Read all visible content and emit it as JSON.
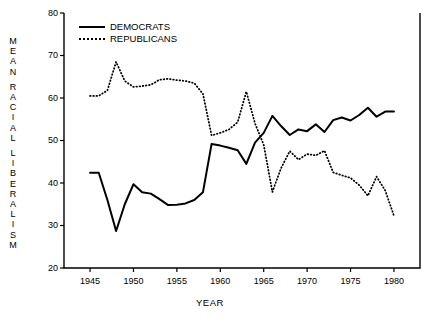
{
  "chart_data": {
    "type": "line",
    "title": "",
    "xlabel": "YEAR",
    "ylabel": "MEAN RACIAL LIBERALISM",
    "xlim": [
      1942,
      1983
    ],
    "ylim": [
      20,
      80
    ],
    "xticks": [
      1945,
      1950,
      1955,
      1960,
      1965,
      1970,
      1975,
      1980
    ],
    "yticks": [
      20,
      30,
      40,
      50,
      60,
      70,
      80
    ],
    "grid": false,
    "legend_position": "top-left",
    "series": [
      {
        "name": "DEMOCRATS",
        "style": "solid",
        "color": "#000000",
        "x": [
          1945,
          1946,
          1947,
          1948,
          1949,
          1950,
          1951,
          1952,
          1953,
          1954,
          1955,
          1956,
          1957,
          1958,
          1959,
          1960,
          1961,
          1962,
          1963,
          1964,
          1965,
          1966,
          1967,
          1968,
          1969,
          1970,
          1971,
          1972,
          1973,
          1974,
          1975,
          1976,
          1977,
          1978,
          1979,
          1980
        ],
        "values": [
          42.4,
          42.4,
          36.0,
          28.7,
          35.0,
          39.7,
          37.8,
          37.5,
          36.2,
          34.8,
          34.9,
          35.2,
          36.0,
          37.8,
          49.2,
          48.8,
          48.3,
          47.7,
          44.5,
          49.5,
          51.8,
          55.8,
          53.4,
          51.3,
          52.6,
          52.2,
          53.8,
          52.0,
          54.8,
          55.4,
          54.7,
          56.0,
          57.7,
          55.6,
          56.8,
          56.8
        ]
      },
      {
        "name": "REPUBLICANS",
        "style": "dotted",
        "color": "#000000",
        "x": [
          1945,
          1946,
          1947,
          1948,
          1949,
          1950,
          1951,
          1952,
          1953,
          1954,
          1955,
          1956,
          1957,
          1958,
          1959,
          1960,
          1961,
          1962,
          1963,
          1964,
          1965,
          1966,
          1967,
          1968,
          1969,
          1970,
          1971,
          1972,
          1973,
          1974,
          1975,
          1976,
          1977,
          1978,
          1979,
          1980
        ],
        "values": [
          60.5,
          60.5,
          61.8,
          68.5,
          64.0,
          62.6,
          62.8,
          63.1,
          64.3,
          64.5,
          64.2,
          64.0,
          63.5,
          61.0,
          51.2,
          51.8,
          52.6,
          54.3,
          61.5,
          54.0,
          49.0,
          37.9,
          43.5,
          47.5,
          45.5,
          46.8,
          46.5,
          47.6,
          42.5,
          41.8,
          41.2,
          39.5,
          37.0,
          41.5,
          38.2,
          32.3
        ]
      }
    ]
  },
  "legend": {
    "entries": [
      {
        "label": "DEMOCRATS",
        "style": "solid"
      },
      {
        "label": "REPUBLICANS",
        "style": "dotted"
      }
    ]
  },
  "ylabel_letters": [
    "M",
    "E",
    "A",
    "N",
    "",
    "R",
    "A",
    "C",
    "I",
    "A",
    "L",
    "",
    "L",
    "I",
    "B",
    "E",
    "R",
    "A",
    "L",
    "I",
    "S",
    "M"
  ]
}
